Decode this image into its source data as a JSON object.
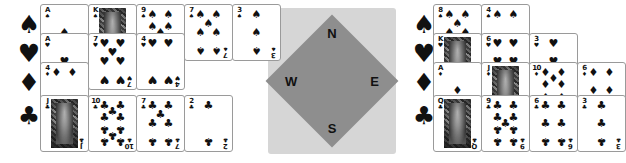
{
  "compass": {
    "north_label": "N",
    "east_label": "E",
    "south_label": "S",
    "west_label": "W",
    "outer_color": "#d6d6d6",
    "inner_color": "#8e8e8e"
  },
  "suit_glyphs": {
    "spade": "♠",
    "heart": "♥",
    "diamond": "♦",
    "club": "♣"
  },
  "hands": [
    {
      "seat": "west",
      "suits": [
        {
          "suit": "spade",
          "marker": "♠",
          "cards": [
            {
              "rank": "A",
              "suit": "♠",
              "face": false
            },
            {
              "rank": "K",
              "suit": "♠",
              "face": true
            },
            {
              "rank": "9",
              "suit": "♠",
              "face": false
            },
            {
              "rank": "7",
              "suit": "♠",
              "face": false
            },
            {
              "rank": "3",
              "suit": "♠",
              "face": false
            }
          ]
        },
        {
          "suit": "heart",
          "marker": "♥",
          "cards": [
            {
              "rank": "A",
              "suit": "♥",
              "face": false
            },
            {
              "rank": "7",
              "suit": "♥",
              "face": false
            },
            {
              "rank": "4",
              "suit": "♥",
              "face": false
            }
          ]
        },
        {
          "suit": "diamond",
          "marker": "♦",
          "cards": [
            {
              "rank": "4",
              "suit": "♦",
              "face": false
            }
          ]
        },
        {
          "suit": "club",
          "marker": "♣",
          "cards": [
            {
              "rank": "J",
              "suit": "♣",
              "face": true
            },
            {
              "rank": "10",
              "suit": "♣",
              "face": false
            },
            {
              "rank": "7",
              "suit": "♣",
              "face": false
            },
            {
              "rank": "2",
              "suit": "♣",
              "face": false
            }
          ]
        }
      ]
    },
    {
      "seat": "east",
      "suits": [
        {
          "suit": "spade",
          "marker": "♠",
          "cards": [
            {
              "rank": "8",
              "suit": "♠",
              "face": false
            },
            {
              "rank": "4",
              "suit": "♠",
              "face": false
            }
          ]
        },
        {
          "suit": "heart",
          "marker": "♥",
          "cards": [
            {
              "rank": "K",
              "suit": "♥",
              "face": true
            },
            {
              "rank": "6",
              "suit": "♥",
              "face": false
            },
            {
              "rank": "3",
              "suit": "♥",
              "face": false
            }
          ]
        },
        {
          "suit": "diamond",
          "marker": "♦",
          "cards": [
            {
              "rank": "A",
              "suit": "♦",
              "face": false
            },
            {
              "rank": "J",
              "suit": "♦",
              "face": true
            },
            {
              "rank": "10",
              "suit": "♦",
              "face": false
            },
            {
              "rank": "6",
              "suit": "♦",
              "face": false
            }
          ]
        },
        {
          "suit": "club",
          "marker": "♣",
          "cards": [
            {
              "rank": "Q",
              "suit": "♣",
              "face": true
            },
            {
              "rank": "9",
              "suit": "♣",
              "face": false
            },
            {
              "rank": "6",
              "suit": "♣",
              "face": false
            },
            {
              "rank": "3",
              "suit": "♣",
              "face": false
            }
          ]
        }
      ]
    }
  ]
}
